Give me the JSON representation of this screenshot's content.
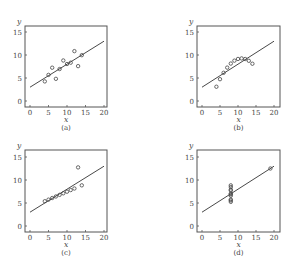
{
  "chart_data": [
    {
      "type": "scatter",
      "panel_label": "(a)",
      "xlabel": "x",
      "ylabel": "y",
      "xlim": [
        0,
        20
      ],
      "ylim": [
        0,
        15
      ],
      "xticks": [
        0,
        5,
        10,
        15,
        20
      ],
      "yticks": [
        0,
        5,
        10,
        15
      ],
      "grid": false,
      "x": [
        10,
        8,
        13,
        9,
        11,
        14,
        6,
        4,
        12,
        7,
        5
      ],
      "y": [
        8.04,
        6.95,
        7.58,
        8.81,
        8.33,
        9.96,
        7.24,
        4.26,
        10.84,
        4.82,
        5.68
      ],
      "fit_line": {
        "intercept": 3.0,
        "slope": 0.5
      }
    },
    {
      "type": "scatter",
      "panel_label": "(b)",
      "xlabel": "x",
      "ylabel": "y",
      "xlim": [
        0,
        20
      ],
      "ylim": [
        0,
        15
      ],
      "xticks": [
        0,
        5,
        10,
        15,
        20
      ],
      "yticks": [
        0,
        5,
        10,
        15
      ],
      "grid": false,
      "x": [
        10,
        8,
        13,
        9,
        11,
        14,
        6,
        4,
        12,
        7,
        5
      ],
      "y": [
        9.14,
        8.14,
        8.74,
        8.77,
        9.26,
        8.1,
        6.13,
        3.1,
        9.13,
        7.26,
        4.74
      ],
      "fit_line": {
        "intercept": 3.0,
        "slope": 0.5
      }
    },
    {
      "type": "scatter",
      "panel_label": "(c)",
      "xlabel": "x",
      "ylabel": "y",
      "xlim": [
        0,
        20
      ],
      "ylim": [
        0,
        15
      ],
      "xticks": [
        0,
        5,
        10,
        15,
        20
      ],
      "yticks": [
        0,
        5,
        10,
        15
      ],
      "grid": false,
      "x": [
        10,
        8,
        13,
        9,
        11,
        14,
        6,
        4,
        12,
        7,
        5
      ],
      "y": [
        7.46,
        6.77,
        12.74,
        7.11,
        7.81,
        8.84,
        6.08,
        5.39,
        8.15,
        6.42,
        5.73
      ],
      "fit_line": {
        "intercept": 3.0,
        "slope": 0.5
      }
    },
    {
      "type": "scatter",
      "panel_label": "(d)",
      "xlabel": "x",
      "ylabel": "y",
      "xlim": [
        0,
        20
      ],
      "ylim": [
        0,
        15
      ],
      "xticks": [
        0,
        5,
        10,
        15,
        20
      ],
      "yticks": [
        0,
        5,
        10,
        15
      ],
      "grid": false,
      "x": [
        8,
        8,
        8,
        8,
        8,
        8,
        8,
        19,
        8,
        8,
        8
      ],
      "y": [
        6.58,
        5.76,
        7.71,
        8.84,
        8.47,
        7.04,
        5.25,
        12.5,
        5.56,
        7.91,
        6.89
      ],
      "fit_line": {
        "intercept": 3.0,
        "slope": 0.5
      }
    }
  ],
  "panels": [
    {
      "label": "(a)",
      "xlabel": "x",
      "ylabel": "y"
    },
    {
      "label": "(b)",
      "xlabel": "x",
      "ylabel": "y"
    },
    {
      "label": "(c)",
      "xlabel": "x",
      "ylabel": "y"
    },
    {
      "label": "(d)",
      "xlabel": "x",
      "ylabel": "y"
    }
  ],
  "colors": {
    "axis": "#555555",
    "marker": "#444444",
    "line": "#333333"
  }
}
